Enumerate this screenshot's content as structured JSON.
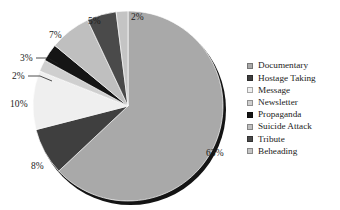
{
  "chart_data": {
    "type": "pie",
    "title": "",
    "subtitle": "",
    "xlabel": "",
    "ylabel": "",
    "grid": false,
    "legend_position": "right",
    "start_angle_deg": 0,
    "direction": "clockwise",
    "value_unit": "percent",
    "categories": [
      "Documentary",
      "Hostage Taking",
      "Message",
      "Newsletter",
      "Propaganda",
      "Suicide Attack",
      "Tribute",
      "Beheading"
    ],
    "values": [
      63,
      8,
      10,
      2,
      3,
      7,
      5,
      2
    ],
    "data_labels": [
      "63%",
      "8%",
      "10%",
      "2%",
      "3%",
      "7%",
      "5%",
      "2%"
    ],
    "slice_colors": [
      "#a9a9a9",
      "#3f3f3f",
      "#efefef",
      "#cfcfcf",
      "#151515",
      "#bfbfbf",
      "#4a4a4a",
      "#c4c4c4"
    ],
    "slices": [
      {
        "label": "Documentary",
        "value": 63,
        "data_label": "63%",
        "color": "#a9a9a9"
      },
      {
        "label": "Hostage Taking",
        "value": 8,
        "data_label": "8%",
        "color": "#3f3f3f"
      },
      {
        "label": "Message",
        "value": 10,
        "data_label": "10%",
        "color": "#efefef"
      },
      {
        "label": "Newsletter",
        "value": 2,
        "data_label": "2%",
        "color": "#cfcfcf"
      },
      {
        "label": "Propaganda",
        "value": 3,
        "data_label": "3%",
        "color": "#151515"
      },
      {
        "label": "Suicide Attack",
        "value": 7,
        "data_label": "7%",
        "color": "#bfbfbf"
      },
      {
        "label": "Tribute",
        "value": 5,
        "data_label": "5%",
        "color": "#4a4a4a"
      },
      {
        "label": "Beheading",
        "value": 2,
        "data_label": "2%",
        "color": "#c4c4c4"
      }
    ],
    "label_positions": [
      {
        "text": "63%",
        "x": 206,
        "y": 148,
        "leader": false
      },
      {
        "text": "8%",
        "x": 31,
        "y": 161,
        "leader": false
      },
      {
        "text": "10%",
        "x": 10,
        "y": 99,
        "leader": false
      },
      {
        "text": "2%",
        "x": 12,
        "y": 71,
        "leader": true
      },
      {
        "text": "3%",
        "x": 20,
        "y": 53,
        "leader": true
      },
      {
        "text": "7%",
        "x": 49,
        "y": 30,
        "leader": false
      },
      {
        "text": "5%",
        "x": 88,
        "y": 16,
        "leader": false
      },
      {
        "text": "2%",
        "x": 131,
        "y": 12,
        "leader": false
      }
    ],
    "style": {
      "pie_center_x": 128,
      "pie_center_y": 106,
      "pie_radius": 95,
      "has_3d_shadow": true,
      "shadow_color": "#141414",
      "background": "#ffffff"
    }
  },
  "legend": {
    "items": [
      {
        "label": "Documentary",
        "color": "#a9a9a9"
      },
      {
        "label": "Hostage Taking",
        "color": "#3f3f3f"
      },
      {
        "label": "Message",
        "color": "#efefef"
      },
      {
        "label": "Newsletter",
        "color": "#cfcfcf"
      },
      {
        "label": "Propaganda",
        "color": "#151515"
      },
      {
        "label": "Suicide Attack",
        "color": "#bfbfbf"
      },
      {
        "label": "Tribute",
        "color": "#4a4a4a"
      },
      {
        "label": "Beheading",
        "color": "#c4c4c4"
      }
    ]
  }
}
